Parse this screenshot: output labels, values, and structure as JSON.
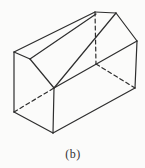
{
  "figure": {
    "label": "(b)",
    "shape_description": "house-shaped pentagonal prism wireframe, hidden edges dashed",
    "background_color": "#fbfbfa",
    "stroke_color": "#2e2e2e",
    "caption_color": "#333333",
    "stroke_width": 1.2,
    "dash_pattern": "4 3",
    "canvas": {
      "width": 145,
      "height": 168
    },
    "edges": [
      {
        "name": "front-roof-left-edge",
        "x1": 14,
        "y1": 52,
        "x2": 30,
        "y2": 59,
        "style": "solid"
      },
      {
        "name": "front-roof-right-edge",
        "x1": 30,
        "y1": 59,
        "x2": 54,
        "y2": 88,
        "style": "solid"
      },
      {
        "name": "front-right-wall-edge",
        "x1": 54,
        "y1": 88,
        "x2": 53,
        "y2": 133,
        "style": "solid"
      },
      {
        "name": "front-bottom-edge",
        "x1": 53,
        "y1": 133,
        "x2": 14,
        "y2": 112,
        "style": "solid"
      },
      {
        "name": "front-left-wall-edge",
        "x1": 14,
        "y1": 112,
        "x2": 14,
        "y2": 52,
        "style": "solid"
      },
      {
        "name": "long-top-left-edge",
        "x1": 14,
        "y1": 52,
        "x2": 95,
        "y2": 12,
        "style": "solid"
      },
      {
        "name": "long-ridge-edge",
        "x1": 30,
        "y1": 59,
        "x2": 96,
        "y2": 14,
        "style": "solid"
      },
      {
        "name": "back-top-edge",
        "x1": 95,
        "y1": 12,
        "x2": 116,
        "y2": 13,
        "style": "solid"
      },
      {
        "name": "back-roof-right-edge",
        "x1": 116,
        "y1": 13,
        "x2": 137,
        "y2": 41,
        "style": "solid"
      },
      {
        "name": "back-right-wall-edge",
        "x1": 137,
        "y1": 41,
        "x2": 135,
        "y2": 88,
        "style": "solid"
      },
      {
        "name": "long-bottom-right-edge",
        "x1": 53,
        "y1": 133,
        "x2": 135,
        "y2": 88,
        "style": "solid"
      },
      {
        "name": "long-right-eave-edge",
        "x1": 54,
        "y1": 88,
        "x2": 137,
        "y2": 41,
        "style": "solid"
      },
      {
        "name": "right-shoulder-back-edge",
        "x1": 54,
        "y1": 88,
        "x2": 116,
        "y2": 13,
        "style": "solid"
      },
      {
        "name": "hidden-back-left-wall-edge",
        "x1": 95,
        "y1": 12,
        "x2": 96,
        "y2": 64,
        "style": "dashed"
      },
      {
        "name": "hidden-back-bottom-edge",
        "x1": 96,
        "y1": 64,
        "x2": 135,
        "y2": 88,
        "style": "dashed"
      },
      {
        "name": "hidden-long-bottom-left-edge",
        "x1": 14,
        "y1": 112,
        "x2": 54,
        "y2": 88,
        "style": "dashed"
      }
    ]
  }
}
